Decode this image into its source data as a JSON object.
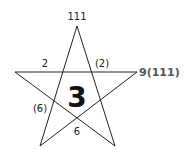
{
  "diagram": {
    "type": "pentagram",
    "stroke_color": "#222222",
    "vertices": {
      "top": [
        77,
        26
      ],
      "left": [
        15,
        72
      ],
      "right": [
        137,
        72
      ],
      "bottom_left": [
        40,
        146
      ],
      "bottom_right": [
        115,
        146
      ]
    },
    "labels": {
      "top": "111",
      "upper_left_edge": "2",
      "upper_right_edge": "(2)",
      "right_side": "9(111)",
      "center": "3",
      "lower_left_edge": "(6)",
      "bottom_center": "6"
    }
  }
}
